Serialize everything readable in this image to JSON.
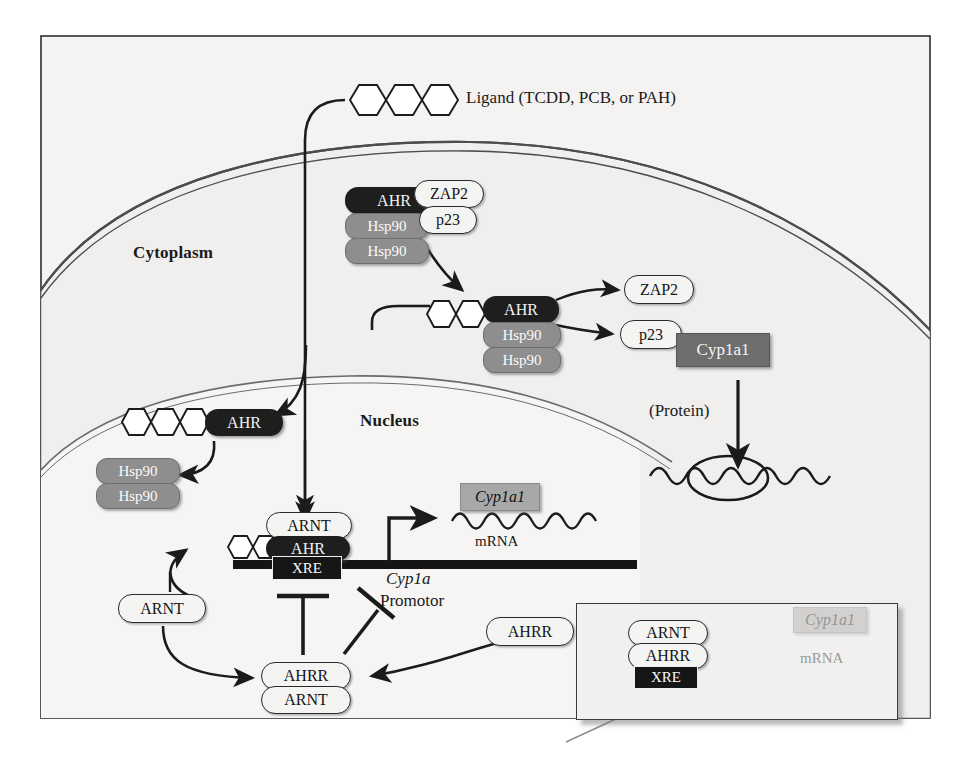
{
  "figure": {
    "compartments": [
      {
        "name": "cytoplasm_label",
        "text": "Cytoplasm"
      },
      {
        "name": "nucleus_label",
        "text": "Nucleus"
      }
    ]
  },
  "ligand": {
    "label": "Ligand (TCDD, PCB, or PAH)",
    "icon": "polycyclic-aromatic-hydrocarbon-icon"
  },
  "cytoplasm": {
    "receptor_complex": {
      "ahr": "AHR",
      "hsp90_a": "Hsp90",
      "hsp90_b": "Hsp90",
      "zap2": "ZAP2",
      "p23": "p23"
    },
    "bound_complex": {
      "ahr": "AHR",
      "hsp90_a": "Hsp90",
      "hsp90_b": "Hsp90"
    },
    "released": {
      "zap2": "ZAP2",
      "p23": "p23"
    },
    "translation": {
      "protein_product": "Cyp1a1",
      "protein_note": "(Protein)",
      "ribosome": "ribosome-icon",
      "mrna": "mrna-wave-icon"
    }
  },
  "nucleus": {
    "imported_complex": {
      "ahr": "AHR"
    },
    "dissociated_chaperones": {
      "hsp90_a": "Hsp90",
      "hsp90_b": "Hsp90"
    },
    "active_transcription": {
      "arnt": "ARNT",
      "ahr": "AHR",
      "xre": "XRE",
      "gene_label": "Cyp1a",
      "promotor_label": "Promotor",
      "transcript_tag": "Cyp1a1",
      "mrna_label": "mRNA"
    },
    "repressor_pathway": {
      "arnt_free": "ARNT",
      "ahrr_free": "AHRR",
      "repressor_complex_top": "AHRR",
      "repressor_complex_bottom": "ARNT"
    }
  },
  "inset": {
    "arnt": "ARNT",
    "ahrr": "AHRR",
    "xre": "XRE",
    "transcript_tag": "Cyp1a1",
    "mrna_label": "mRNA",
    "blocked": "blocked-transcription-icon"
  },
  "colors": {
    "dark_pill": "#1e1e1e",
    "gray_pill": "#8e8e8e",
    "gray_box": "#a8a8a8",
    "protein_box": "#6e6e6e",
    "frame": "#3a3a3a",
    "membrane": "#555555"
  }
}
